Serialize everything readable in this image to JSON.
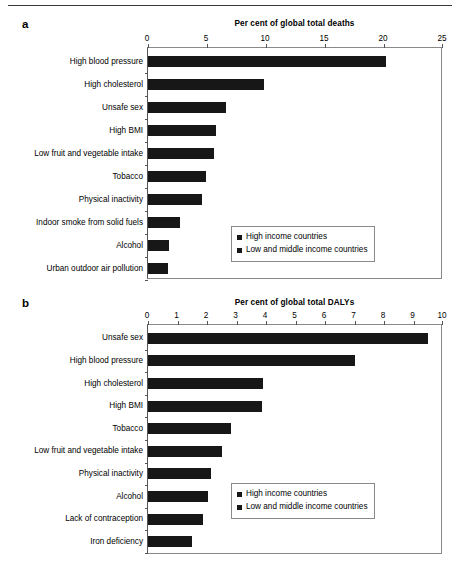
{
  "figure": {
    "has_top_rule": true,
    "bar_color": "#171717",
    "axis_color": "#8a8a8a"
  },
  "panel_a": {
    "letter": "a",
    "legend": {
      "items": [
        {
          "label": "High income countries",
          "color": "#171717"
        },
        {
          "label": "Low and middle income countries",
          "color": "#171717"
        }
      ]
    }
  },
  "panel_b": {
    "letter": "b",
    "legend": {
      "items": [
        {
          "label": "High income countries",
          "color": "#171717"
        },
        {
          "label": "Low and middle income countries",
          "color": "#171717"
        }
      ]
    }
  },
  "chart_data": [
    {
      "type": "bar",
      "orientation": "horizontal",
      "panel": "a",
      "title": "Per cent of global total deaths",
      "xlabel": "Per cent of global total deaths",
      "ylabel": "",
      "xlim": [
        0,
        25
      ],
      "xticks": [
        0,
        5,
        10,
        15,
        20,
        25
      ],
      "xticklabels": [
        "0",
        "5",
        "10",
        "15",
        "20",
        "25"
      ],
      "grid": false,
      "legend_position": "lower-right",
      "legend_entries": [
        "High income countries",
        "Low and middle income countries"
      ],
      "categories": [
        "High blood pressure",
        "High cholesterol",
        "Unsafe sex",
        "High BMI",
        "Low fruit and vegetable intake",
        "Tobacco",
        "Physical inactivity",
        "Indoor smoke from solid fuels",
        "Alcohol",
        "Urban outdoor air pollution"
      ],
      "values": [
        20.2,
        9.8,
        6.6,
        5.8,
        5.6,
        4.9,
        4.6,
        2.7,
        1.8,
        1.7
      ]
    },
    {
      "type": "bar",
      "orientation": "horizontal",
      "panel": "b",
      "title": "Per cent of global total DALYs",
      "xlabel": "Per cent of global total DALYs",
      "ylabel": "",
      "xlim": [
        0,
        10
      ],
      "xticks": [
        0,
        1,
        2,
        3,
        4,
        5,
        6,
        7,
        8,
        9,
        10
      ],
      "xticklabels": [
        "0",
        "1",
        "2",
        "3",
        "4",
        "5",
        "6",
        "7",
        "8",
        "9",
        "10"
      ],
      "grid": false,
      "legend_position": "lower-right",
      "legend_entries": [
        "High income countries",
        "Low and middle income countries"
      ],
      "categories": [
        "Unsafe sex",
        "High blood pressure",
        "High cholesterol",
        "High BMI",
        "Tobacco",
        "Low fruit and vegetable intake",
        "Physical inactivity",
        "Alcohol",
        "Lack of contraception",
        "Iron deficiency"
      ],
      "values": [
        9.5,
        7.0,
        3.9,
        3.85,
        2.8,
        2.5,
        2.15,
        2.05,
        1.85,
        1.5
      ]
    }
  ]
}
